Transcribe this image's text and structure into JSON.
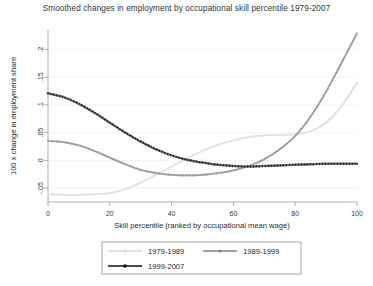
{
  "chart_data": {
    "type": "line",
    "title": "Smoothed changes in employment by occupational skill percentile 1979-2007",
    "xlabel": "Skill percentile (ranked by occupational mean wage)",
    "ylabel": "100 x change in employment share",
    "xlim": [
      0,
      100
    ],
    "ylim": [
      -0.075,
      0.235
    ],
    "xticks": [
      0,
      20,
      40,
      60,
      80,
      100
    ],
    "xticklabels": [
      "0",
      "20",
      "40",
      "60",
      "80",
      "100"
    ],
    "yticks": [
      -0.05,
      0,
      0.05,
      0.1,
      0.15,
      0.2
    ],
    "yticklabels": [
      "-.05",
      "0",
      ".05",
      ".1",
      ".15",
      ".2"
    ],
    "grid": true,
    "legend_position": "bottom",
    "marker": "dotted-circles",
    "x": [
      0,
      5,
      10,
      15,
      20,
      25,
      30,
      35,
      40,
      45,
      50,
      55,
      60,
      65,
      70,
      75,
      80,
      85,
      90,
      95,
      100
    ],
    "series": [
      {
        "name": "1979-1989",
        "color": "#d8d8d8",
        "values": [
          -0.061,
          -0.062,
          -0.062,
          -0.061,
          -0.059,
          -0.052,
          -0.04,
          -0.026,
          -0.011,
          0.004,
          0.017,
          0.028,
          0.036,
          0.042,
          0.045,
          0.046,
          0.047,
          0.052,
          0.068,
          0.098,
          0.14
        ]
      },
      {
        "name": "1989-1999",
        "color": "#808080",
        "values": [
          0.035,
          0.033,
          0.027,
          0.017,
          0.005,
          -0.007,
          -0.017,
          -0.023,
          -0.026,
          -0.027,
          -0.026,
          -0.023,
          -0.018,
          -0.01,
          0.002,
          0.02,
          0.044,
          0.079,
          0.124,
          0.176,
          0.229
        ]
      },
      {
        "name": "1999-2007",
        "color": "#101010",
        "values": [
          0.121,
          0.114,
          0.102,
          0.086,
          0.068,
          0.05,
          0.034,
          0.02,
          0.009,
          0.001,
          -0.004,
          -0.008,
          -0.01,
          -0.011,
          -0.01,
          -0.009,
          -0.008,
          -0.007,
          -0.006,
          -0.006,
          -0.006
        ]
      }
    ]
  },
  "legend": {
    "entries": [
      {
        "label": "1979-1989"
      },
      {
        "label": "1989-1999"
      },
      {
        "label": "1999-2007"
      }
    ]
  }
}
